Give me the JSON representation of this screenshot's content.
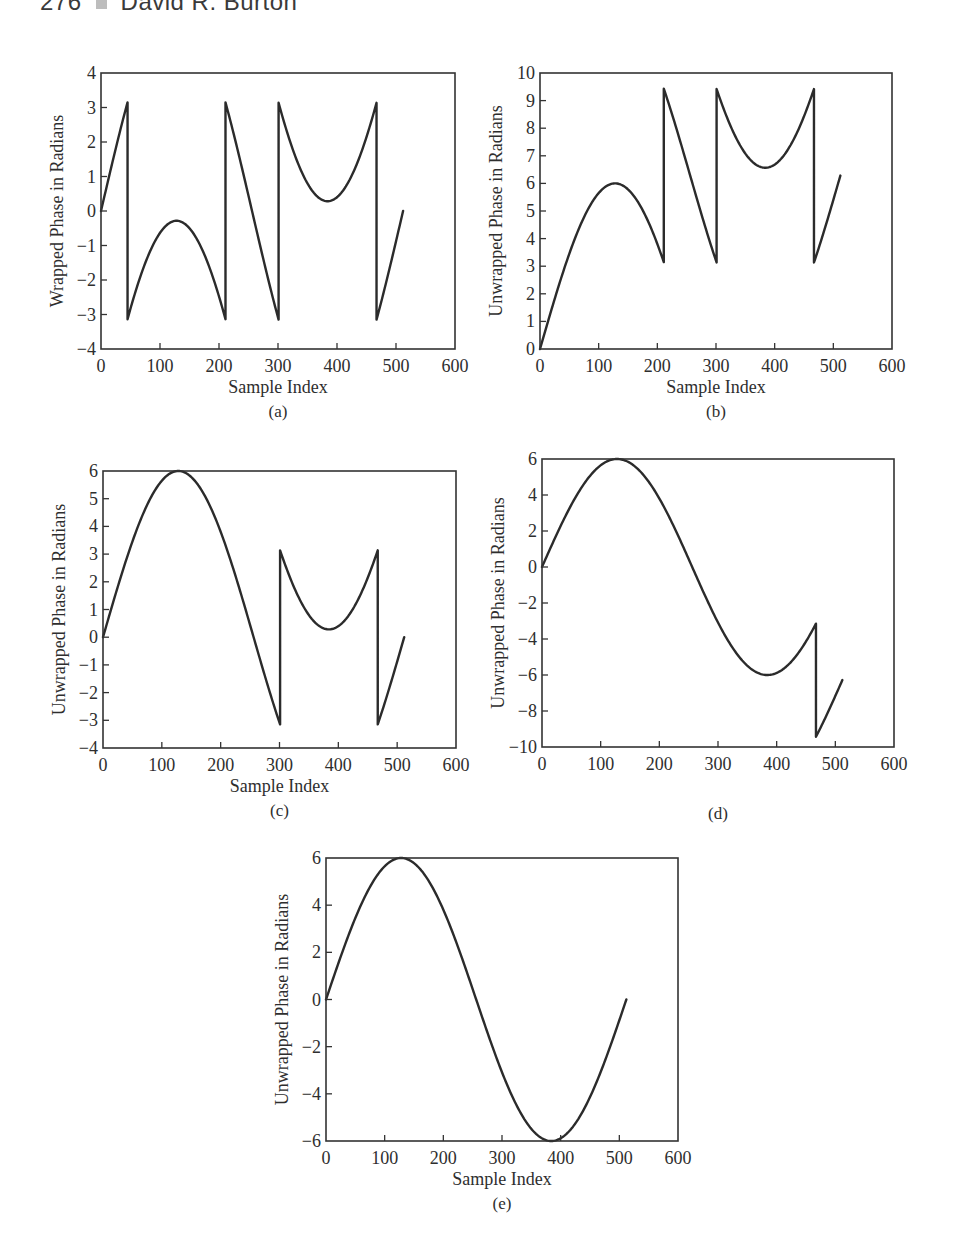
{
  "page": {
    "running_head": {
      "page_number": "276",
      "author": "David R. Burton"
    }
  },
  "chart_data": [
    {
      "id": "a",
      "type": "line",
      "panel_label": "(a)",
      "title": "",
      "xlabel": "Sample Index",
      "ylabel": "Wrapped Phase in Radians",
      "xlim": [
        0,
        600
      ],
      "ylim": [
        -4,
        4
      ],
      "xticks": [
        0,
        100,
        200,
        300,
        400,
        500,
        600
      ],
      "yticks": [
        -4,
        -3,
        -2,
        -1,
        0,
        1,
        2,
        3,
        4
      ],
      "grid": false,
      "box_px": {
        "left": 101,
        "top": 73,
        "right": 455,
        "bottom": 349
      },
      "description": "Wrapped phase of 6*sin(2*pi*n/512), wrapped into (-pi, pi]",
      "segments": [
        {
          "from": 0,
          "to": 45,
          "offset": 0
        },
        {
          "from": 45,
          "to": 211,
          "offset": -6.2832
        },
        {
          "from": 211,
          "to": 301,
          "offset": 0
        },
        {
          "from": 301,
          "to": 467,
          "offset": 6.2832
        },
        {
          "from": 467,
          "to": 512,
          "offset": 0
        }
      ],
      "key_points": [
        {
          "x": 0,
          "y": 0
        },
        {
          "x": 45,
          "y": 3.14
        },
        {
          "x": 45,
          "y": -3.14
        },
        {
          "x": 128,
          "y": -0.28
        },
        {
          "x": 211,
          "y": -3.14
        },
        {
          "x": 211,
          "y": 3.14
        },
        {
          "x": 301,
          "y": -3.14
        },
        {
          "x": 301,
          "y": 3.14
        },
        {
          "x": 384,
          "y": 0.28
        },
        {
          "x": 467,
          "y": 3.14
        },
        {
          "x": 467,
          "y": -3.14
        },
        {
          "x": 512,
          "y": 0
        }
      ]
    },
    {
      "id": "b",
      "type": "line",
      "panel_label": "(b)",
      "title": "",
      "xlabel": "Sample Index",
      "ylabel": "Unwrapped Phase in Radians",
      "xlim": [
        0,
        600
      ],
      "ylim": [
        0,
        10
      ],
      "xticks": [
        0,
        100,
        200,
        300,
        400,
        500,
        600
      ],
      "yticks": [
        0,
        1,
        2,
        3,
        4,
        5,
        6,
        7,
        8,
        9,
        10
      ],
      "grid": false,
      "box_px": {
        "left": 540,
        "top": 73,
        "right": 892,
        "bottom": 349
      },
      "description": "Partial unwrapping: first discontinuity corrected only",
      "segments": [
        {
          "from": 0,
          "to": 211,
          "offset": 0
        },
        {
          "from": 211,
          "to": 301,
          "offset": 6.2832
        },
        {
          "from": 301,
          "to": 467,
          "offset": 12.5664
        },
        {
          "from": 467,
          "to": 512,
          "offset": 6.2832
        }
      ],
      "key_points": [
        {
          "x": 0,
          "y": 0
        },
        {
          "x": 128,
          "y": 6.0
        },
        {
          "x": 211,
          "y": 3.14
        },
        {
          "x": 211,
          "y": 9.42
        },
        {
          "x": 301,
          "y": 3.3
        },
        {
          "x": 301,
          "y": 9.42
        },
        {
          "x": 384,
          "y": 6.6
        },
        {
          "x": 467,
          "y": 9.42
        },
        {
          "x": 467,
          "y": 3.3
        },
        {
          "x": 512,
          "y": 6.28
        }
      ]
    },
    {
      "id": "c",
      "type": "line",
      "panel_label": "(c)",
      "title": "",
      "xlabel": "Sample Index",
      "ylabel": "Unwrapped Phase in Radians",
      "xlim": [
        0,
        600
      ],
      "ylim": [
        -4,
        6
      ],
      "xticks": [
        0,
        100,
        200,
        300,
        400,
        500,
        600
      ],
      "yticks": [
        -4,
        -3,
        -2,
        -1,
        0,
        1,
        2,
        3,
        4,
        5,
        6
      ],
      "grid": false,
      "box_px": {
        "left": 103,
        "top": 471,
        "right": 456,
        "bottom": 748
      },
      "description": "Partial unwrapping: first two discontinuities corrected",
      "segments": [
        {
          "from": 0,
          "to": 301,
          "offset": 0
        },
        {
          "from": 301,
          "to": 467,
          "offset": 6.2832
        },
        {
          "from": 467,
          "to": 512,
          "offset": 0
        }
      ],
      "key_points": [
        {
          "x": 0,
          "y": 0
        },
        {
          "x": 128,
          "y": 6.0
        },
        {
          "x": 301,
          "y": -3.14
        },
        {
          "x": 301,
          "y": 3.14
        },
        {
          "x": 384,
          "y": 0.28
        },
        {
          "x": 467,
          "y": 3.14
        },
        {
          "x": 467,
          "y": -3.14
        },
        {
          "x": 512,
          "y": 0
        }
      ]
    },
    {
      "id": "d",
      "type": "line",
      "panel_label": "(d)",
      "title": "",
      "xlabel": "",
      "ylabel": "Unwrapped Phase in Radians",
      "xlim": [
        0,
        600
      ],
      "ylim": [
        -10,
        6
      ],
      "xticks": [
        0,
        100,
        200,
        300,
        400,
        500,
        600
      ],
      "yticks": [
        -10,
        -8,
        -6,
        -4,
        -2,
        0,
        2,
        4,
        6
      ],
      "grid": false,
      "box_px": {
        "left": 542,
        "top": 459,
        "right": 894,
        "bottom": 747
      },
      "description": "Partial unwrapping: three discontinuities corrected, last one over-corrected",
      "segments": [
        {
          "from": 0,
          "to": 467,
          "offset": 0
        },
        {
          "from": 467,
          "to": 512,
          "offset": -6.2832
        }
      ],
      "key_points": [
        {
          "x": 0,
          "y": 0
        },
        {
          "x": 128,
          "y": 6.0
        },
        {
          "x": 384,
          "y": -6.0
        },
        {
          "x": 467,
          "y": -3.14
        },
        {
          "x": 467,
          "y": -9.42
        },
        {
          "x": 512,
          "y": -6.28
        }
      ]
    },
    {
      "id": "e",
      "type": "line",
      "panel_label": "(e)",
      "title": "",
      "xlabel": "Sample Index",
      "ylabel": "Unwrapped Phase in Radians",
      "xlim": [
        0,
        600
      ],
      "ylim": [
        -6,
        6
      ],
      "xticks": [
        0,
        100,
        200,
        300,
        400,
        500,
        600
      ],
      "yticks": [
        -6,
        -4,
        -2,
        0,
        2,
        4,
        6
      ],
      "grid": false,
      "box_px": {
        "left": 326,
        "top": 858,
        "right": 678,
        "bottom": 1141
      },
      "description": "Fully unwrapped phase: 6*sin(2*pi*n/512)",
      "segments": [
        {
          "from": 0,
          "to": 512,
          "offset": 0
        }
      ],
      "key_points": [
        {
          "x": 0,
          "y": 0
        },
        {
          "x": 128,
          "y": 6.0
        },
        {
          "x": 256,
          "y": 0
        },
        {
          "x": 384,
          "y": -6.0
        },
        {
          "x": 512,
          "y": 0
        }
      ]
    }
  ],
  "signal": {
    "amplitude": 6,
    "period": 512,
    "n_max": 512
  }
}
